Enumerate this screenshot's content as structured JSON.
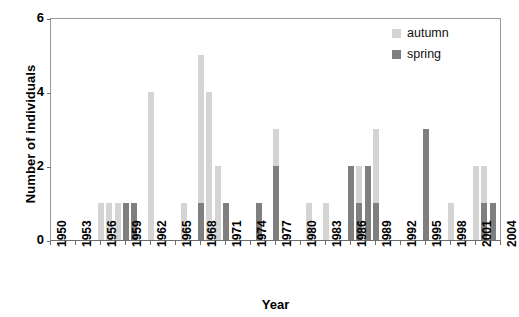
{
  "chart_data": {
    "type": "bar",
    "stacked": true,
    "title": "",
    "xlabel": "Year",
    "ylabel": "Number of individuals",
    "ylim": [
      0,
      6
    ],
    "yticks": [
      0,
      2,
      4,
      6
    ],
    "xlim": [
      1950,
      2004
    ],
    "xticks": [
      1950,
      1953,
      1956,
      1959,
      1962,
      1965,
      1968,
      1971,
      1974,
      1977,
      1980,
      1983,
      1986,
      1989,
      1992,
      1995,
      1998,
      2001,
      2004
    ],
    "grid": false,
    "legend_position": "top-right",
    "series": [
      {
        "name": "autumn",
        "color": "#d4d4d4",
        "values": [
          {
            "year": 1956,
            "value": 1
          },
          {
            "year": 1957,
            "value": 1
          },
          {
            "year": 1958,
            "value": 1
          },
          {
            "year": 1962,
            "value": 4
          },
          {
            "year": 1966,
            "value": 1
          },
          {
            "year": 1968,
            "value": 4
          },
          {
            "year": 1969,
            "value": 4
          },
          {
            "year": 1970,
            "value": 2
          },
          {
            "year": 1977,
            "value": 1
          },
          {
            "year": 1981,
            "value": 1
          },
          {
            "year": 1983,
            "value": 1
          },
          {
            "year": 1987,
            "value": 1
          },
          {
            "year": 1989,
            "value": 2
          },
          {
            "year": 1998,
            "value": 1
          },
          {
            "year": 2001,
            "value": 2
          },
          {
            "year": 2002,
            "value": 1
          }
        ]
      },
      {
        "name": "spring",
        "color": "#7f7f7f",
        "values": [
          {
            "year": 1959,
            "value": 1
          },
          {
            "year": 1960,
            "value": 1
          },
          {
            "year": 1968,
            "value": 1
          },
          {
            "year": 1971,
            "value": 1
          },
          {
            "year": 1975,
            "value": 1
          },
          {
            "year": 1977,
            "value": 2
          },
          {
            "year": 1986,
            "value": 2
          },
          {
            "year": 1987,
            "value": 1
          },
          {
            "year": 1988,
            "value": 2
          },
          {
            "year": 1989,
            "value": 1
          },
          {
            "year": 1995,
            "value": 3
          },
          {
            "year": 2002,
            "value": 1
          },
          {
            "year": 2003,
            "value": 1
          }
        ]
      }
    ],
    "bars": [
      {
        "year": 1956,
        "spring": 0,
        "autumn": 1
      },
      {
        "year": 1957,
        "spring": 0,
        "autumn": 1
      },
      {
        "year": 1958,
        "spring": 0,
        "autumn": 1
      },
      {
        "year": 1959,
        "spring": 1,
        "autumn": 0
      },
      {
        "year": 1960,
        "spring": 1,
        "autumn": 0
      },
      {
        "year": 1962,
        "spring": 0,
        "autumn": 4
      },
      {
        "year": 1966,
        "spring": 0,
        "autumn": 1
      },
      {
        "year": 1968,
        "spring": 1,
        "autumn": 4
      },
      {
        "year": 1969,
        "spring": 0,
        "autumn": 4
      },
      {
        "year": 1970,
        "spring": 0,
        "autumn": 2
      },
      {
        "year": 1971,
        "spring": 1,
        "autumn": 0
      },
      {
        "year": 1975,
        "spring": 1,
        "autumn": 0
      },
      {
        "year": 1977,
        "spring": 2,
        "autumn": 1
      },
      {
        "year": 1981,
        "spring": 0,
        "autumn": 1
      },
      {
        "year": 1983,
        "spring": 0,
        "autumn": 1
      },
      {
        "year": 1986,
        "spring": 2,
        "autumn": 0
      },
      {
        "year": 1987,
        "spring": 1,
        "autumn": 1
      },
      {
        "year": 1988,
        "spring": 2,
        "autumn": 0
      },
      {
        "year": 1989,
        "spring": 1,
        "autumn": 2
      },
      {
        "year": 1995,
        "spring": 3,
        "autumn": 0
      },
      {
        "year": 1998,
        "spring": 0,
        "autumn": 1
      },
      {
        "year": 2001,
        "spring": 0,
        "autumn": 2
      },
      {
        "year": 2002,
        "spring": 1,
        "autumn": 1
      },
      {
        "year": 2003,
        "spring": 1,
        "autumn": 0
      }
    ]
  },
  "legend": {
    "items": [
      {
        "label": "autumn",
        "color": "#d4d4d4"
      },
      {
        "label": "spring",
        "color": "#7f7f7f"
      }
    ]
  },
  "axes": {
    "x_title": "Year",
    "y_title": "Number of individuals"
  }
}
